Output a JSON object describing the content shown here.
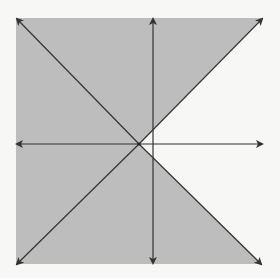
{
  "diagram": {
    "type": "shaded-inequality-region",
    "colors": {
      "background": "#f7f7f5",
      "shade": "#bdbdbd",
      "line": "#333333"
    },
    "labels": []
  }
}
